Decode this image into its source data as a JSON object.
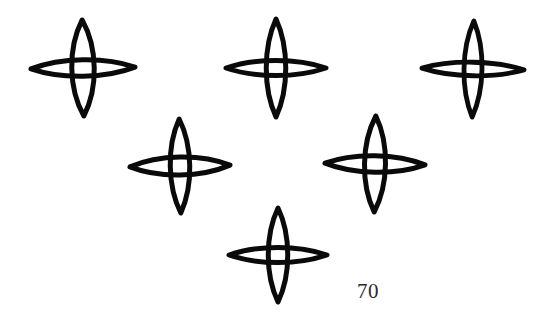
{
  "figure": {
    "caption_number": "70",
    "caption_position": {
      "x": 357,
      "y": 281
    },
    "background_color": "#ffffff",
    "ink_color": "#0a0a0a",
    "caption_color": "#2a2a2a",
    "width": 548,
    "height": 322,
    "motif_name": "four-pointed-star",
    "motif_count": 6,
    "stars": [
      {
        "id": "star-top-left",
        "label": "top-left star",
        "cx": 83,
        "cy": 68,
        "half_width": 52,
        "half_height": 48,
        "v_bulge": 15,
        "h_bulge": 11,
        "stroke_width": 5.0,
        "rotation": -1
      },
      {
        "id": "star-top-center",
        "label": "top-center star",
        "cx": 276,
        "cy": 68,
        "half_width": 50,
        "half_height": 49,
        "v_bulge": 13,
        "h_bulge": 10,
        "stroke_width": 5.0,
        "rotation": 0
      },
      {
        "id": "star-top-right",
        "label": "top-right star",
        "cx": 473,
        "cy": 69,
        "half_width": 51,
        "half_height": 48,
        "v_bulge": 12,
        "h_bulge": 9,
        "stroke_width": 4.8,
        "rotation": 1
      },
      {
        "id": "star-middle-left",
        "label": "middle-left star",
        "cx": 180,
        "cy": 166,
        "half_width": 50,
        "half_height": 47,
        "v_bulge": 13,
        "h_bulge": 12,
        "stroke_width": 5.0,
        "rotation": -1
      },
      {
        "id": "star-middle-right",
        "label": "middle-right star",
        "cx": 375,
        "cy": 164,
        "half_width": 50,
        "half_height": 48,
        "v_bulge": 14,
        "h_bulge": 11,
        "stroke_width": 5.0,
        "rotation": 1
      },
      {
        "id": "star-bottom-center",
        "label": "bottom-center star",
        "cx": 278,
        "cy": 255,
        "half_width": 49,
        "half_height": 47,
        "v_bulge": 13,
        "h_bulge": 10,
        "stroke_width": 5.0,
        "rotation": 0
      }
    ]
  }
}
